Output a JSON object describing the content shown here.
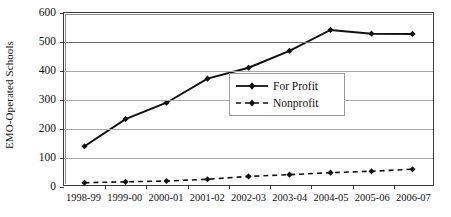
{
  "chart_data": {
    "type": "line",
    "title": "",
    "xlabel": "",
    "ylabel": "EMO-Operated Schools",
    "categories": [
      "1998-99",
      "1999-00",
      "2000-01",
      "2001-02",
      "2002-03",
      "2003-04",
      "2004-05",
      "2005-06",
      "2006-07"
    ],
    "series": [
      {
        "name": "For Profit",
        "style": "solid",
        "marker": "diamond",
        "values": [
          135,
          230,
          287,
          371,
          409,
          468,
          541,
          528,
          527
        ]
      },
      {
        "name": "Nonprofit",
        "style": "dashed",
        "marker": "diamond",
        "values": [
          8,
          11,
          14,
          20,
          30,
          36,
          43,
          48,
          55
        ]
      }
    ],
    "ylim": [
      0,
      600
    ],
    "yticks": [
      0,
      100,
      200,
      300,
      400,
      500,
      600
    ],
    "ytick_labels": [
      "0",
      "100",
      "200",
      "300",
      "400",
      "500",
      "600"
    ],
    "grid": true,
    "grid_axis": "y",
    "legend_position": "center-right",
    "colors": {
      "line": "#111111",
      "grid": "#a8a8a8",
      "frame": "#3a3a3a",
      "background": "#ffffff"
    }
  },
  "legend": {
    "items": [
      {
        "label": "For Profit",
        "style": "solid"
      },
      {
        "label": "Nonprofit",
        "style": "dashed"
      }
    ]
  }
}
